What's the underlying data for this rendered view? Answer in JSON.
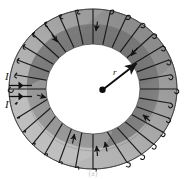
{
  "figure": {
    "caption": "(a)",
    "labels": {
      "current_top": "I",
      "current_bottom": "I",
      "radius": "r"
    },
    "colors": {
      "background": "#ffffff",
      "ring_outer_light": "#b0b0b0",
      "ring_inner_dark": "#7b7b7b",
      "ring_face_mid": "#9a9a9a",
      "ring_highlight": "#c6c6c6",
      "wire": "#141414",
      "label": "#111111",
      "caption": "#c8c8c8"
    },
    "geometry": {
      "center_x": 93,
      "center_y": 89,
      "outer_rx": 84,
      "outer_ry": 80,
      "inner_rx": 47,
      "inner_ry": 45,
      "segment_count": 30,
      "radius_arrow_from": "center dot",
      "radius_arrow_to": "inner edge upper-right"
    },
    "elements": {
      "center_dot": "center-dot",
      "radius_arrow": "radius-arrow",
      "lead_wire_top": "lead-wire-top",
      "lead_wire_bottom": "lead-wire-bottom",
      "toroid_body": "toroid-body",
      "winding_segments": "winding-segments",
      "winding_wires": "winding-wires",
      "current_arrows": "current-direction-arrows"
    }
  }
}
